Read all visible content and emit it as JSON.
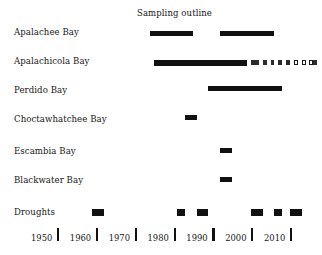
{
  "chart_data": {
    "type": "bar",
    "title": "Sampling outline",
    "xlabel": "",
    "ylabel": "",
    "xlim": [
      1945,
      2017
    ],
    "grid": false,
    "legend": null,
    "orientation": "horizontal-timeline",
    "categories": [
      "Apalachee Bay",
      "Apalachicola Bay",
      "Perdido Bay",
      "Choctawhatchee Bay",
      "Escambia Bay",
      "Blackwater Bay",
      "Droughts"
    ],
    "axis_ticks": [
      1950,
      1960,
      1970,
      1980,
      1990,
      2000,
      2010
    ],
    "axis_tick_labels": [
      "1950",
      "1960",
      "1970",
      "1980",
      "1990",
      "2000",
      "2010"
    ],
    "series": [
      {
        "name": "Apalachee Bay",
        "intervals": [
          {
            "start": 1974,
            "end": 1985,
            "style": "solid"
          },
          {
            "start": 1992,
            "end": 2006,
            "style": "solid"
          }
        ]
      },
      {
        "name": "Apalachicola Bay",
        "intervals": [
          {
            "start": 1975,
            "end": 1999,
            "style": "solid"
          },
          {
            "start": 2000,
            "end": 2002,
            "style": "dashed"
          },
          {
            "start": 2003,
            "end": 2004,
            "style": "dashed"
          },
          {
            "start": 2005,
            "end": 2006,
            "style": "dashed"
          },
          {
            "start": 2007,
            "end": 2008,
            "style": "dashed"
          },
          {
            "start": 2009,
            "end": 2010,
            "style": "dashed"
          },
          {
            "start": 2011,
            "end": 2012,
            "style": "dashed-open"
          },
          {
            "start": 2013,
            "end": 2014,
            "style": "dashed-open"
          },
          {
            "start": 2015,
            "end": 2016,
            "style": "dashed-open"
          },
          {
            "start": 2016,
            "end": 2017,
            "style": "dashed"
          }
        ]
      },
      {
        "name": "Perdido Bay",
        "intervals": [
          {
            "start": 1989,
            "end": 2008,
            "style": "solid"
          }
        ]
      },
      {
        "name": "Choctawhatchee Bay",
        "intervals": [
          {
            "start": 1983,
            "end": 1986,
            "style": "solid"
          }
        ]
      },
      {
        "name": "Escambia Bay",
        "intervals": [
          {
            "start": 1992,
            "end": 1995,
            "style": "solid"
          }
        ]
      },
      {
        "name": "Blackwater Bay",
        "intervals": [
          {
            "start": 1992,
            "end": 1995,
            "style": "solid"
          }
        ]
      },
      {
        "name": "Droughts",
        "intervals": [
          {
            "start": 1959,
            "end": 1962,
            "style": "solid"
          },
          {
            "start": 1981,
            "end": 1983,
            "style": "solid"
          },
          {
            "start": 1986,
            "end": 1989,
            "style": "solid"
          },
          {
            "start": 2000,
            "end": 2003,
            "style": "solid"
          },
          {
            "start": 2006,
            "end": 2008,
            "style": "solid"
          },
          {
            "start": 2010,
            "end": 2013,
            "style": "solid"
          }
        ]
      }
    ]
  },
  "layout": {
    "label_x": 14,
    "plot_left": 57,
    "plot_right": 290,
    "year_min": 1950,
    "year_max": 2010,
    "row_y": {
      "Apalachee Bay": 31,
      "Apalachicola Bay": 60,
      "Perdido Bay": 86,
      "Choctawhatchee Bay": 115,
      "Escambia Bay": 148,
      "Blackwater Bay": 177,
      "Droughts": 209
    },
    "label_baseline_y": {
      "Apalachee Bay": 27,
      "Apalachicola Bay": 56,
      "Perdido Bay": 85,
      "Choctawhatchee Bay": 114,
      "Escambia Bay": 146,
      "Blackwater Bay": 175,
      "Droughts": 207
    },
    "title_x": 137,
    "title_y": 8,
    "tick_y": 228,
    "tick_label_y": 233
  }
}
